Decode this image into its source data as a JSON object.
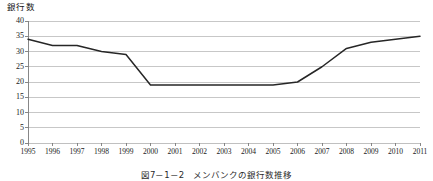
{
  "figure": {
    "caption": "図7－1－2　メンバンクの銀行数推移",
    "y_axis_title": "銀行数"
  },
  "chart_data": {
    "type": "line",
    "title": "",
    "subtitle": "",
    "xlabel": "",
    "ylabel": "銀行数",
    "categories": [
      "1995",
      "1996",
      "1997",
      "1998",
      "1999",
      "2000",
      "2001",
      "2002",
      "2003",
      "2004",
      "2005",
      "2006",
      "2007",
      "2008",
      "2009",
      "2010",
      "2011"
    ],
    "values": [
      34,
      32,
      32,
      30,
      29,
      19,
      19,
      19,
      19,
      19,
      19,
      20,
      25,
      31,
      33,
      34,
      35
    ],
    "series": [
      {
        "name": "銀行数",
        "values": [
          34,
          32,
          32,
          30,
          29,
          19,
          19,
          19,
          19,
          19,
          19,
          20,
          25,
          31,
          33,
          34,
          35
        ]
      }
    ],
    "ylim": [
      0,
      40
    ],
    "y_ticks": [
      0,
      5,
      10,
      15,
      20,
      25,
      30,
      35,
      40
    ],
    "y_tick_labels": [
      "0",
      "5",
      "10",
      "15",
      "20",
      "25",
      "30",
      "35",
      "40"
    ],
    "x_tick_labels": [
      "1995",
      "1996",
      "1997",
      "1998",
      "1999",
      "2000",
      "2001",
      "2002",
      "2003",
      "2004",
      "2005",
      "2006",
      "2007",
      "2008",
      "2009",
      "2010",
      "2011"
    ],
    "grid": true,
    "grid_axis": "y",
    "legend": false,
    "legend_position": "none",
    "line_color": "#262626",
    "grid_color": "#b9b9b9",
    "axis_color": "#7a7a7a",
    "background_color": "#ffffff",
    "annotations": []
  }
}
